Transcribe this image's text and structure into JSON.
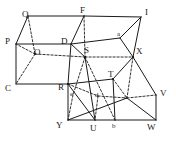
{
  "figure": {
    "type": "geometry-diagram",
    "width": 176,
    "height": 141,
    "background_color": "#ffffff",
    "line_color": "#1a1a1a",
    "labels": {
      "Q": "Q",
      "F": "F",
      "I": "I",
      "P": "P",
      "O": "O",
      "D": "D",
      "S": "S",
      "X": "X",
      "C": "C",
      "R": "R",
      "T": "T",
      "V": "V",
      "Y": "Y",
      "U": "U",
      "W": "W",
      "a": "a",
      "b": "b",
      "c": "c",
      "d": "d",
      "e": "e"
    },
    "vertices": [
      {
        "name": "Q",
        "case": "upper",
        "x": 28,
        "y": 16,
        "lx": 22,
        "ly": 10
      },
      {
        "name": "F",
        "case": "upper",
        "x": 84,
        "y": 16,
        "lx": 80,
        "ly": 8
      },
      {
        "name": "I",
        "case": "upper",
        "x": 141,
        "y": 17,
        "lx": 145,
        "ly": 10
      },
      {
        "name": "P",
        "case": "upper",
        "x": 16,
        "y": 44,
        "lx": 7,
        "ly": 38
      },
      {
        "name": "O",
        "case": "upper",
        "x": 35,
        "y": 54,
        "lx": 33,
        "ly": 49
      },
      {
        "name": "D",
        "case": "upper",
        "x": 71,
        "y": 44,
        "lx": 62,
        "ly": 38
      },
      {
        "name": "S",
        "case": "upper",
        "x": 85,
        "y": 57,
        "lx": 84,
        "ly": 48
      },
      {
        "name": "X",
        "case": "upper",
        "x": 133,
        "y": 57,
        "lx": 136,
        "ly": 49
      },
      {
        "name": "C",
        "case": "upper",
        "x": 16,
        "y": 84,
        "lx": 6,
        "ly": 84
      },
      {
        "name": "R",
        "case": "upper",
        "x": 68,
        "y": 84,
        "lx": 59,
        "ly": 84
      },
      {
        "name": "T",
        "case": "upper",
        "x": 113,
        "y": 79,
        "lx": 109,
        "ly": 72
      },
      {
        "name": "V",
        "case": "upper",
        "x": 156,
        "y": 95,
        "lx": 159,
        "ly": 90
      },
      {
        "name": "Y",
        "case": "upper",
        "x": 68,
        "y": 120,
        "lx": 57,
        "ly": 121
      },
      {
        "name": "U",
        "case": "upper",
        "x": 95,
        "y": 120,
        "lx": 90,
        "ly": 124
      },
      {
        "name": "W",
        "case": "upper",
        "x": 156,
        "y": 120,
        "lx": 148,
        "ly": 123
      },
      {
        "name": "a",
        "case": "lower",
        "x": 120,
        "y": 38,
        "lx": 118,
        "ly": 32
      },
      {
        "name": "b",
        "case": "lower",
        "x": 115,
        "y": 120,
        "lx": 112,
        "ly": 124
      },
      {
        "name": "c",
        "case": "lower",
        "x": 127,
        "y": 98,
        "lx": 124,
        "ly": 95
      },
      {
        "name": "d",
        "case": "lower",
        "x": 98,
        "y": 96,
        "lx": 95,
        "ly": 93
      },
      {
        "name": "e",
        "case": "lower",
        "x": 73,
        "y": 95,
        "lx": 70,
        "ly": 92
      }
    ],
    "solid_edges": [
      [
        "Q",
        "F"
      ],
      [
        "F",
        "I"
      ],
      [
        "Q",
        "P"
      ],
      [
        "P",
        "D"
      ],
      [
        "D",
        "F"
      ],
      [
        "I",
        "X"
      ],
      [
        "D",
        "S"
      ],
      [
        "P",
        "C"
      ],
      [
        "C",
        "R"
      ],
      [
        "R",
        "D"
      ],
      [
        "R",
        "Y"
      ],
      [
        "Y",
        "U"
      ],
      [
        "U",
        "W"
      ],
      [
        "W",
        "V"
      ],
      [
        "V",
        "X"
      ],
      [
        "X",
        "T"
      ],
      [
        "T",
        "R"
      ],
      [
        "T",
        "W"
      ],
      [
        "U",
        "S"
      ],
      [
        "Y",
        "c"
      ],
      [
        "b",
        "T"
      ],
      [
        "a",
        "I"
      ],
      [
        "P",
        "a"
      ],
      [
        "b",
        "W"
      ],
      [
        "R",
        "U"
      ]
    ],
    "hidden_edges": [
      [
        "Q",
        "O"
      ],
      [
        "O",
        "P"
      ],
      [
        "O",
        "C"
      ],
      [
        "O",
        "S"
      ],
      [
        "S",
        "X"
      ],
      [
        "F",
        "S"
      ],
      [
        "R",
        "d"
      ],
      [
        "d",
        "c"
      ],
      [
        "c",
        "V"
      ],
      [
        "S",
        "e"
      ],
      [
        "S",
        "b"
      ],
      [
        "e",
        "Y"
      ],
      [
        "d",
        "U"
      ],
      [
        "T",
        "c"
      ],
      [
        "X",
        "c"
      ]
    ]
  }
}
